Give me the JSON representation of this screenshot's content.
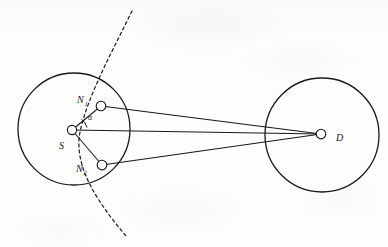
{
  "figure": {
    "type": "geometric-diagram",
    "background_color": "#fdfdfc",
    "stroke_color": "#15181c"
  },
  "circles": [
    {
      "name": "left-circle",
      "cx": 74,
      "cy": 129,
      "r": 56,
      "stroke": "#15181c",
      "stroke_width": 1.3
    },
    {
      "name": "right-circle",
      "cx": 322,
      "cy": 135,
      "r": 57,
      "stroke": "#15181c",
      "stroke_width": 1.3
    }
  ],
  "nodes": [
    {
      "id": "S",
      "label": "S",
      "subscript": "",
      "cx": 72,
      "cy": 130,
      "r": 4.6,
      "label_x": 59,
      "label_y": 149
    },
    {
      "id": "N1",
      "label": "N",
      "subscript": "1",
      "cx": 101,
      "cy": 106,
      "r": 4.8,
      "label_x": 77,
      "label_y": 103
    },
    {
      "id": "N2",
      "label": "N",
      "subscript": "2",
      "cx": 102,
      "cy": 165,
      "r": 4.8,
      "label_x": 76,
      "label_y": 172
    },
    {
      "id": "D",
      "label": "D",
      "subscript": "",
      "cx": 321,
      "cy": 134,
      "r": 4.8,
      "label_x": 336,
      "label_y": 141
    }
  ],
  "edges": [
    {
      "name": "edge-s-n1",
      "from": "S",
      "to": "N1"
    },
    {
      "name": "edge-s-n2",
      "from": "S",
      "to": "N2"
    },
    {
      "name": "edge-n1-d",
      "from": "N1",
      "to": "D"
    },
    {
      "name": "edge-n2-d",
      "from": "N2",
      "to": "D"
    },
    {
      "name": "edge-s-d",
      "from": "S",
      "to": "D"
    }
  ],
  "angle": {
    "name": "alpha-angle",
    "symbol": "α",
    "vertex": "S",
    "label_x": 88,
    "label_y": 120,
    "arc_radius": 15
  },
  "dashed_curve": {
    "name": "dashed-boundary-arc",
    "style": "dashed",
    "dash_pattern": "3 3",
    "stroke_width": 1.2,
    "path": "M 132 11 C 112 52, 88 95, 80 132 C 73 168, 100 205, 126 236"
  }
}
